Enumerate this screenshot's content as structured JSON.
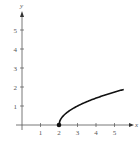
{
  "chart_data": {
    "type": "line",
    "title": "",
    "xlabel": "x",
    "ylabel": "y",
    "xlim": [
      0,
      6
    ],
    "ylim": [
      0,
      6
    ],
    "grid": false,
    "x_ticks": [
      "1",
      "2",
      "3",
      "4",
      "5"
    ],
    "y_ticks": [
      "1",
      "2",
      "3",
      "4",
      "5"
    ],
    "series": [
      {
        "name": "y = sqrt(x - 2)",
        "x": [
          2,
          2.25,
          2.5,
          3,
          3.5,
          4,
          4.5,
          5,
          5.5
        ],
        "values": [
          0,
          0.5,
          0.71,
          1,
          1.22,
          1.41,
          1.58,
          1.73,
          1.87
        ]
      }
    ],
    "annotations": [
      {
        "type": "point",
        "x": 2,
        "y": 0,
        "label": "filled endpoint"
      }
    ]
  },
  "colors": {
    "axis": "#555555",
    "curve": "#111111"
  }
}
